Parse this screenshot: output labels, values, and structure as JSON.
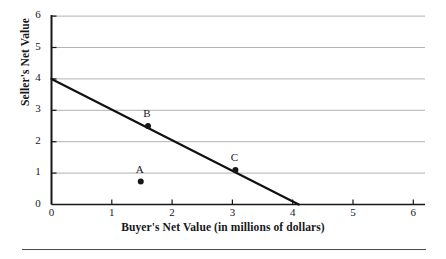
{
  "figure": {
    "background_color": "#ffffff",
    "ink_color": "#17171a",
    "grid_color": "#b2b2b5",
    "axis_color": "#17171a",
    "rule_color": "#4a4a52"
  },
  "chart_data": {
    "type": "line",
    "title": "",
    "subtitle": "",
    "xlabel": "Buyer's Net Value (in millions of dollars)",
    "ylabel": "Seller's Net Value",
    "xlim": [
      0,
      6
    ],
    "ylim": [
      0,
      6
    ],
    "xticks": [
      "0",
      "1",
      "2",
      "3",
      "4",
      "5",
      "6"
    ],
    "yticks": [
      "0",
      "1",
      "2",
      "3",
      "4",
      "5",
      "6"
    ],
    "xtick_values": [
      0,
      1,
      2,
      3,
      4,
      5,
      6
    ],
    "ytick_values": [
      0,
      1,
      2,
      3,
      4,
      5,
      6
    ],
    "grid": "horizontal",
    "grid_y_values": [
      1,
      2,
      3,
      4,
      5,
      6
    ],
    "legend": "none",
    "series": [
      {
        "name": "bargaining frontier",
        "type": "line",
        "x": [
          0,
          4.1
        ],
        "y": [
          4.0,
          0.0
        ],
        "color": "#111114",
        "width": 2.2
      }
    ],
    "points": [
      {
        "label": "A",
        "x": 1.48,
        "y": 0.73,
        "on_line": false,
        "label_position": "above"
      },
      {
        "label": "B",
        "x": 1.6,
        "y": 2.5,
        "on_line": true,
        "label_position": "above"
      },
      {
        "label": "C",
        "x": 3.05,
        "y": 1.1,
        "on_line": true,
        "label_position": "above"
      }
    ],
    "annotations": []
  }
}
